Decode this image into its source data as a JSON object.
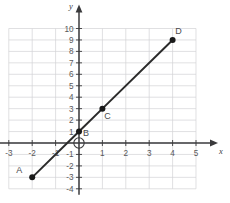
{
  "chart_data": {
    "type": "line",
    "title": "",
    "xlabel": "x",
    "ylabel": "y",
    "xlim": [
      -3,
      5
    ],
    "ylim": [
      -4,
      10
    ],
    "grid": true,
    "legend": "none",
    "x_ticks": [
      "-3",
      "-2",
      "-1",
      "1",
      "2",
      "3",
      "4",
      "5"
    ],
    "x_tick_values": [
      -3,
      -2,
      -1,
      1,
      2,
      3,
      4,
      5
    ],
    "y_ticks": [
      "10",
      "9",
      "8",
      "7",
      "6",
      "5",
      "4",
      "3",
      "2",
      "1",
      "-1",
      "-2",
      "-3",
      "-4"
    ],
    "y_tick_values": [
      10,
      9,
      8,
      7,
      6,
      5,
      4,
      3,
      2,
      1,
      -1,
      -2,
      -3,
      -4
    ],
    "series": [
      {
        "name": "line",
        "equation": "y = 2x + 1",
        "x": [
          -2,
          0,
          1,
          4
        ],
        "values": [
          -3,
          1,
          3,
          9
        ]
      }
    ],
    "points": [
      {
        "label": "A",
        "x": -2,
        "y": -3,
        "label_dx": -13,
        "label_dy": -4
      },
      {
        "label": "B",
        "x": 0,
        "y": 1,
        "label_dx": 7,
        "label_dy": 4
      },
      {
        "label": "C",
        "x": 1,
        "y": 3,
        "label_dx": 5,
        "label_dy": 10
      },
      {
        "label": "D",
        "x": 4,
        "y": 9,
        "label_dx": 6,
        "label_dy": -6
      }
    ],
    "origin_marker": {
      "name": "origin-circle",
      "x": 0,
      "y": 0,
      "style": "open-circle"
    },
    "colors": {
      "grid": "#d3d3d6",
      "axis": "#3a3a3c",
      "line": "#2b2b2b",
      "point": "#1a1a1a",
      "tick_text": "#58585a",
      "background": "#ffffff"
    }
  }
}
